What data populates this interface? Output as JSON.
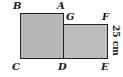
{
  "diagram": {
    "type": "geometry",
    "colors": {
      "fill": "#b8b8b8",
      "stroke": "#222222",
      "text": "#1a1a1a"
    },
    "shapes": [
      {
        "id": "square-ABCD",
        "vertices": [
          "A",
          "B",
          "C",
          "D"
        ]
      },
      {
        "id": "rect-GFED",
        "vertices": [
          "G",
          "F",
          "E",
          "D"
        ]
      }
    ],
    "labels": {
      "B": "B",
      "A": "A",
      "G": "G",
      "F": "F",
      "C": "C",
      "D": "D",
      "E": "E"
    },
    "dimension": {
      "side": "FE",
      "text": "25 cm"
    }
  }
}
